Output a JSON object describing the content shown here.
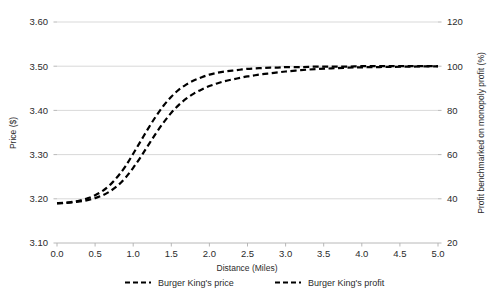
{
  "chart_data": {
    "type": "line",
    "title": "",
    "xlabel": "Distance (Miles)",
    "ylabel": "Price ($)",
    "y2label": "Profit benchmarked on monopoly profit (%)",
    "grid": true,
    "legend_position": "bottom",
    "xlim": [
      0.0,
      5.0
    ],
    "ylim": [
      3.1,
      3.6
    ],
    "y2lim": [
      20,
      120
    ],
    "xticks": [
      "0.0",
      "0.5",
      "1.0",
      "1.5",
      "2.0",
      "2.5",
      "3.0",
      "3.5",
      "4.0",
      "4.5",
      "5.0"
    ],
    "xtick_values": [
      0.0,
      0.5,
      1.0,
      1.5,
      2.0,
      2.5,
      3.0,
      3.5,
      4.0,
      4.5,
      5.0
    ],
    "yticks": [
      "3.10",
      "3.20",
      "3.30",
      "3.40",
      "3.50",
      "3.60"
    ],
    "ytick_values": [
      3.1,
      3.2,
      3.3,
      3.4,
      3.5,
      3.6
    ],
    "y2ticks": [
      "20",
      "40",
      "60",
      "80",
      "100",
      "120"
    ],
    "y2tick_values": [
      20,
      40,
      60,
      80,
      100,
      120
    ],
    "x": [
      0.0,
      0.1,
      0.2,
      0.3,
      0.4,
      0.5,
      0.6,
      0.7,
      0.8,
      0.9,
      1.0,
      1.1,
      1.2,
      1.3,
      1.4,
      1.5,
      1.6,
      1.7,
      1.8,
      1.9,
      2.0,
      2.1,
      2.2,
      2.3,
      2.4,
      2.5,
      2.6,
      2.7,
      2.8,
      2.9,
      3.0,
      3.2,
      3.4,
      3.6,
      3.8,
      4.0,
      4.2,
      4.4,
      4.6,
      4.8,
      5.0
    ],
    "series": [
      {
        "name": "Burger King's price",
        "axis": "left",
        "style": "dashed",
        "color": "#000000",
        "values": [
          3.19,
          3.191,
          3.193,
          3.196,
          3.201,
          3.208,
          3.218,
          3.232,
          3.251,
          3.274,
          3.302,
          3.331,
          3.36,
          3.387,
          3.411,
          3.431,
          3.447,
          3.459,
          3.468,
          3.475,
          3.481,
          3.485,
          3.488,
          3.49,
          3.492,
          3.494,
          3.495,
          3.496,
          3.497,
          3.497,
          3.498,
          3.498,
          3.499,
          3.499,
          3.499,
          3.5,
          3.5,
          3.5,
          3.5,
          3.5,
          3.5
        ]
      },
      {
        "name": "Burger King's profit",
        "axis": "right",
        "style": "dashed",
        "color": "#000000",
        "values": [
          37.9,
          38.1,
          38.4,
          38.8,
          39.4,
          40.3,
          41.6,
          43.5,
          46.1,
          49.6,
          54.0,
          59.0,
          64.4,
          69.7,
          74.6,
          78.9,
          82.5,
          85.4,
          87.7,
          89.5,
          91.0,
          92.2,
          93.2,
          94.0,
          94.7,
          95.4,
          95.9,
          96.4,
          96.8,
          97.2,
          97.6,
          98.2,
          98.7,
          99.0,
          99.3,
          99.5,
          99.6,
          99.7,
          99.8,
          99.9,
          99.9
        ]
      }
    ],
    "legend": [
      {
        "label": "Burger King's price"
      },
      {
        "label": "Burger King's profit"
      }
    ]
  }
}
